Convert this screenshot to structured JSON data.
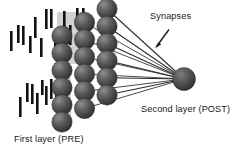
{
  "figure": {
    "title_visible": false,
    "background_color": "#ffffff",
    "width": 242,
    "height": 149
  },
  "labels": {
    "synapses": "Synapses",
    "second_layer": "Second layer (POST)",
    "first_layer": "First layer (PRE)"
  },
  "colors": {
    "spike_bar": "#121212",
    "spike_backdrop": "#d2d2d2",
    "sphere_dark": "#3a3a3a",
    "sphere_mid": "#555555",
    "sphere_light": "#8a8a8a",
    "connection_line": "#2b2b2b",
    "arrow": "#1a1a1a",
    "text": "#1a1a1a"
  },
  "diagram": {
    "type": "neural-network-two-layer",
    "pre_layer": {
      "name": "First layer (PRE)",
      "sphere_columns": 3,
      "sphere_rows": 6,
      "sphere_count": 18
    },
    "post_layer": {
      "name": "Second layer (POST)",
      "sphere_count": 1,
      "center_x": 184,
      "center_y": 79,
      "radius": 11.5
    },
    "synapse_line_count": 6,
    "spike_trains": [
      {
        "id": "upper-raster",
        "backdrop": {
          "x": 57,
          "y": 12,
          "width": 30,
          "height": 52
        },
        "bars": [
          {
            "x": 10,
            "y": 31,
            "h": 20
          },
          {
            "x": 17,
            "y": 25,
            "h": 18
          },
          {
            "x": 22,
            "y": 26,
            "h": 19
          },
          {
            "x": 29,
            "y": 36,
            "h": 17
          },
          {
            "x": 34,
            "y": 17,
            "h": 21
          },
          {
            "x": 40,
            "y": 38,
            "h": 19
          },
          {
            "x": 45,
            "y": 9,
            "h": 20
          },
          {
            "x": 50,
            "y": 9,
            "h": 19
          },
          {
            "x": 54,
            "y": 37,
            "h": 18
          },
          {
            "x": 59,
            "y": 36,
            "h": 21
          },
          {
            "x": 63,
            "y": 11,
            "h": 22
          },
          {
            "x": 69,
            "y": 25,
            "h": 20
          },
          {
            "x": 76,
            "y": 8,
            "h": 18
          },
          {
            "x": 82,
            "y": 8,
            "h": 19
          },
          {
            "x": 86,
            "y": 31,
            "h": 20
          }
        ]
      },
      {
        "id": "lower-raster",
        "backdrop": {
          "x": 57,
          "y": 78,
          "width": 14,
          "height": 45
        },
        "bars": [
          {
            "x": 19,
            "y": 97,
            "h": 20
          },
          {
            "x": 26,
            "y": 83,
            "h": 19
          },
          {
            "x": 31,
            "y": 84,
            "h": 20
          },
          {
            "x": 36,
            "y": 93,
            "h": 21
          },
          {
            "x": 41,
            "y": 80,
            "h": 15
          },
          {
            "x": 45,
            "y": 86,
            "h": 19
          },
          {
            "x": 50,
            "y": 79,
            "h": 20
          },
          {
            "x": 55,
            "y": 94,
            "h": 18
          },
          {
            "x": 62,
            "y": 85,
            "h": 22
          }
        ]
      }
    ]
  }
}
